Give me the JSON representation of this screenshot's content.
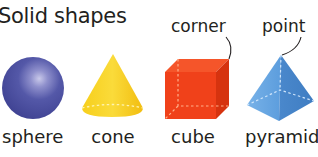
{
  "title": "Solid shapes",
  "callouts": {
    "corner": "corner",
    "point": "point"
  },
  "shapes": [
    {
      "name": "sphere",
      "label": "sphere",
      "color": "#4B4FA0",
      "icon": "sphere-icon"
    },
    {
      "name": "cone",
      "label": "cone",
      "color": "#F5C518",
      "icon": "cone-icon"
    },
    {
      "name": "cube",
      "label": "cube",
      "color": "#F0411A",
      "icon": "cube-icon"
    },
    {
      "name": "pyramid",
      "label": "pyramid",
      "color": "#5A9BDC",
      "icon": "pyramid-icon"
    }
  ]
}
